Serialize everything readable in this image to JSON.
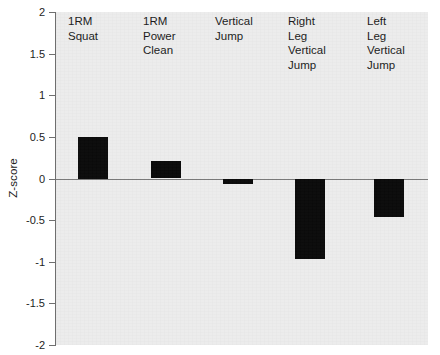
{
  "chart_data": {
    "type": "bar",
    "title": "",
    "subtitle": "",
    "xlabel": "",
    "ylabel": "Z-score",
    "ylim": [
      -2,
      2
    ],
    "yticks": [
      2,
      1.5,
      1,
      0.5,
      0,
      -0.5,
      -1,
      -1.5,
      -2
    ],
    "ytick_labels": [
      "2",
      "1.5",
      "1",
      "0.5",
      "0",
      "-0.5",
      "-1",
      "-1.5",
      "-2"
    ],
    "grid": false,
    "legend": null,
    "bar_color": "#0a0a0a",
    "panel_color": "#ececec",
    "axis_color": "#6f6f6f",
    "categories": [
      "1RM\nSquat",
      "1RM\nPower\nClean",
      "Vertical\nJump",
      "Right\nLeg\nVertical\nJump",
      "Left\nLeg\nVertical\nJump"
    ],
    "values": [
      0.5,
      0.21,
      -0.07,
      -0.97,
      -0.46
    ],
    "series": [
      {
        "name": "Z-score",
        "values": [
          0.5,
          0.21,
          -0.07,
          -0.97,
          -0.46
        ]
      }
    ]
  }
}
